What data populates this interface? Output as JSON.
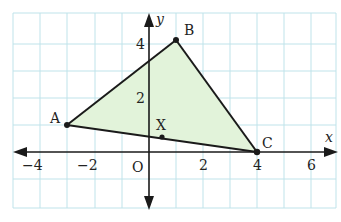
{
  "figure": {
    "type": "coordinate-geometry",
    "axes": {
      "x_label": "x",
      "y_label": "y",
      "origin_label": "O",
      "x_ticks": [
        {
          "value": -4,
          "label": "−4"
        },
        {
          "value": -2,
          "label": "−2"
        },
        {
          "value": 2,
          "label": "2"
        },
        {
          "value": 4,
          "label": "4"
        },
        {
          "value": 6,
          "label": "6"
        }
      ],
      "y_ticks": [
        {
          "value": 2,
          "label": "2"
        },
        {
          "value": 4,
          "label": "4"
        }
      ],
      "x_range": [
        -5,
        7
      ],
      "y_range": [
        -2,
        5
      ]
    },
    "grid": {
      "on": true,
      "color": "#bfe3ea"
    },
    "triangle": {
      "fill": "#e2f3da",
      "stroke": "#1a1a1a",
      "vertices": [
        {
          "name": "A",
          "x": -3,
          "y": 1
        },
        {
          "name": "B",
          "x": 1,
          "y": 4.25
        },
        {
          "name": "C",
          "x": 4,
          "y": 0
        }
      ]
    },
    "points": [
      {
        "name": "A",
        "label": "A"
      },
      {
        "name": "B",
        "label": "B"
      },
      {
        "name": "C",
        "label": "C"
      },
      {
        "name": "X",
        "label": "X",
        "x": 0.5,
        "y": 0.35
      }
    ]
  }
}
